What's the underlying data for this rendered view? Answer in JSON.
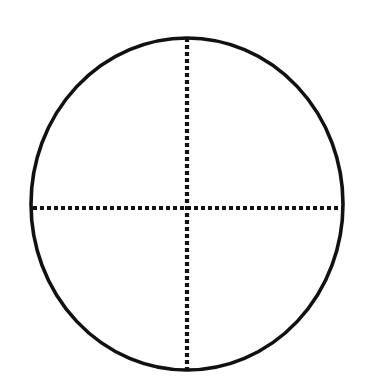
{
  "canvas": {
    "width": 368,
    "height": 390,
    "background_color": "#ffffff"
  },
  "figure": {
    "shape_type": "circle",
    "stroke_color": "#111111",
    "dot_color": "#111111"
  },
  "chart_data": {
    "type": "diagram",
    "xlabel": "",
    "ylabel": "",
    "shapes": [
      {
        "name": "outline-circle",
        "kind": "ellipse",
        "center_x": 187,
        "center_y": 204,
        "radius_x": 156,
        "radius_y": 166,
        "stroke": "#111111",
        "stroke_width": 3.6,
        "fill": "none",
        "line_style": "solid"
      },
      {
        "name": "vertical-diameter",
        "kind": "line",
        "x1": 187,
        "y1": 38,
        "x2": 187,
        "y2": 370,
        "stroke": "#111111",
        "stroke_width": 4.2,
        "line_style": "dotted",
        "dash_length": 4,
        "gap_length": 3
      },
      {
        "name": "horizontal-diameter",
        "kind": "line",
        "x1": 33,
        "y1": 208,
        "x2": 342,
        "y2": 208,
        "stroke": "#111111",
        "stroke_width": 4.2,
        "line_style": "dotted",
        "dash_length": 4,
        "gap_length": 3
      }
    ],
    "center_point": {
      "x": 187,
      "y": 204
    },
    "quadrant_count": 4,
    "legend": [],
    "annotations": [],
    "grid": false
  }
}
